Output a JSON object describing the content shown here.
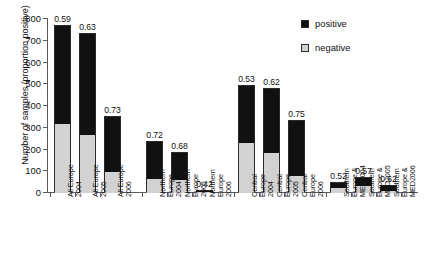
{
  "chart_data": {
    "type": "bar",
    "subtype": "stacked-bar",
    "title": "",
    "xlabel": "",
    "ylabel": "Number of samples (proportion positive)",
    "ylim": [
      0,
      800
    ],
    "yticks": [
      0,
      100,
      200,
      300,
      400,
      500,
      600,
      700,
      800
    ],
    "ytick_labels": [
      "0",
      "100",
      "200",
      "300",
      "400",
      "500",
      "600",
      "700",
      "800"
    ],
    "grid": false,
    "legend_position": "top-right",
    "legend": [
      "positive",
      "negative"
    ],
    "colors": {
      "positive": "#111111",
      "negative": "#d2d2d2",
      "axis": "#5a5a5a",
      "text": "#111111",
      "background": "#ffffff"
    },
    "categories": [
      "All Europe 2004",
      "All Europe 2005",
      "All Europe 2006",
      "Northern Europe 2004",
      "Northern Europe 2005",
      "Northern Europe 2006",
      "Central Europe 2004",
      "Central Europe 2005",
      "Central Europe 2006",
      "Southern Europe & MED2004",
      "Southern Europe & MED2005",
      "Southern Europe & MED2006"
    ],
    "series": [
      {
        "name": "positive",
        "values": [
          455,
          462,
          253,
          169,
          127,
          4,
          260,
          295,
          250,
          23,
          40,
          19
        ]
      },
      {
        "name": "negative",
        "values": [
          315,
          268,
          95,
          66,
          58,
          6,
          230,
          185,
          80,
          22,
          30,
          11
        ]
      }
    ],
    "totals": [
      770,
      730,
      348,
      235,
      185,
      10,
      490,
      480,
      330,
      45,
      70,
      30
    ],
    "annotations": [
      "0.59",
      "0.63",
      "0.73",
      "0.72",
      "0.68",
      "0.42",
      "0.53",
      "0.62",
      "0.75",
      "0.52",
      "0.57",
      "0.62"
    ],
    "annotation_meaning": "proportion positive"
  },
  "axis": {
    "y_title": "Number of samples (proportion positive)"
  },
  "legend": {
    "items": [
      {
        "label": "positive",
        "swatch": "black-square-icon"
      },
      {
        "label": "negative",
        "swatch": "gray-square-icon"
      }
    ]
  },
  "bars": [
    {
      "label": "0.59",
      "lines": [
        "All Europe",
        "2004"
      ],
      "total": 770,
      "negative": 315,
      "positive": 455
    },
    {
      "label": "0.63",
      "lines": [
        "All Europe",
        "2005"
      ],
      "total": 730,
      "negative": 268,
      "positive": 462
    },
    {
      "label": "0.73",
      "lines": [
        "All Europe",
        "2006"
      ],
      "total": 348,
      "negative": 95,
      "positive": 253
    },
    {
      "label": "0.72",
      "lines": [
        "Northern",
        "Europe",
        "2004"
      ],
      "total": 235,
      "negative": 66,
      "positive": 169
    },
    {
      "label": "0.68",
      "lines": [
        "Northern",
        "Europe",
        "2005"
      ],
      "total": 185,
      "negative": 58,
      "positive": 127
    },
    {
      "label": "0.42",
      "lines": [
        "Northern",
        "Europe",
        "2006"
      ],
      "total": 10,
      "negative": 6,
      "positive": 4
    },
    {
      "label": "0.53",
      "lines": [
        "Central",
        "Europe",
        "2004"
      ],
      "total": 490,
      "negative": 230,
      "positive": 260
    },
    {
      "label": "0.62",
      "lines": [
        "Central",
        "Europe",
        "2005"
      ],
      "total": 480,
      "negative": 185,
      "positive": 295
    },
    {
      "label": "0.75",
      "lines": [
        "Central",
        "Europe",
        "2006"
      ],
      "total": 330,
      "negative": 80,
      "positive": 250
    },
    {
      "label": "0.52",
      "lines": [
        "Southern",
        "Europe &",
        "MED2004"
      ],
      "total": 45,
      "negative": 22,
      "positive": 23
    },
    {
      "label": "0.57",
      "lines": [
        "Southern",
        "Europe &",
        "MED2005"
      ],
      "total": 70,
      "negative": 30,
      "positive": 40
    },
    {
      "label": "0.62",
      "lines": [
        "Southern",
        "Europe &",
        "MED2006"
      ],
      "total": 30,
      "negative": 11,
      "positive": 19
    }
  ]
}
